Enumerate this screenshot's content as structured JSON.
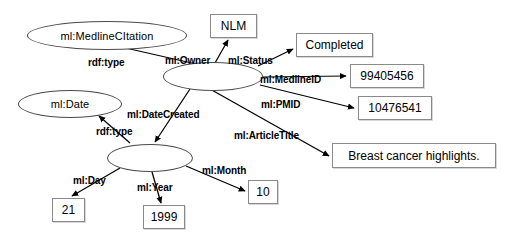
{
  "diagram": {
    "stroke_color": "#000000",
    "node_border_color": "#4a4a4a",
    "box_border_color": "#8a8a8a",
    "nodes": {
      "medline_citation": {
        "label": "ml:MedlineCItation",
        "shape": "ellipse"
      },
      "citation_blank": {
        "label": "",
        "shape": "ellipse"
      },
      "date_class": {
        "label": "ml:Date",
        "shape": "ellipse"
      },
      "date_blank": {
        "label": "",
        "shape": "ellipse"
      },
      "nlm": {
        "label": "NLM",
        "shape": "rect"
      },
      "completed": {
        "label": "Completed",
        "shape": "rect"
      },
      "medline_id": {
        "label": "99405456",
        "shape": "rect"
      },
      "pmid": {
        "label": "10476541",
        "shape": "rect"
      },
      "article_title": {
        "label": "Breast cancer highlights.",
        "shape": "rect"
      },
      "day": {
        "label": "21",
        "shape": "rect"
      },
      "year": {
        "label": "1999",
        "shape": "rect"
      },
      "month": {
        "label": "10",
        "shape": "rect"
      }
    },
    "edges": {
      "rdf_type_citation": "rdf:type",
      "owner": "ml:Owner",
      "status": "ml:Status",
      "medline_id": "ml:MedlineID",
      "pmid": "ml:PMID",
      "article_title": "ml:ArticleTitle",
      "date_created": "ml:DateCreated",
      "rdf_type_date": "rdf:type",
      "day": "ml:Day",
      "year": "ml:Year",
      "month": "ml:Month"
    }
  }
}
